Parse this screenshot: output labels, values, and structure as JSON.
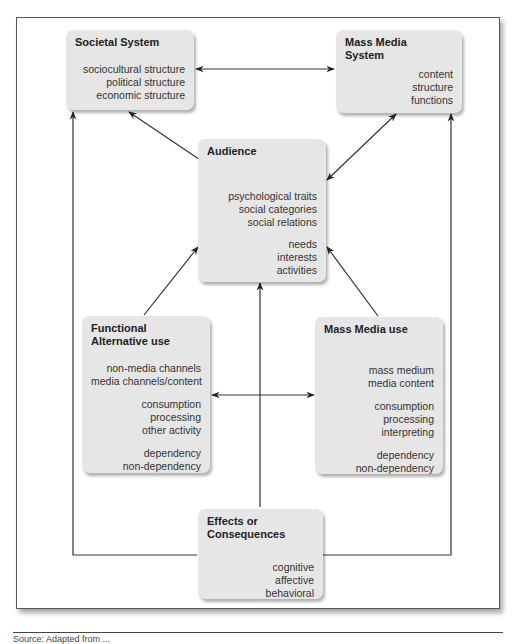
{
  "diagram": {
    "boxes": {
      "societal": {
        "title_lines": [
          "Societal System"
        ],
        "groups": [
          [
            "sociocultural structure",
            "political structure",
            "economic structure"
          ]
        ]
      },
      "mass_media_system": {
        "title_lines": [
          "Mass Media",
          "System"
        ],
        "groups": [
          [
            "content",
            "structure",
            "functions"
          ]
        ]
      },
      "audience": {
        "title_lines": [
          "Audience"
        ],
        "groups": [
          [
            "psychological traits",
            "social categories",
            "social relations"
          ],
          [
            "needs",
            "interests",
            "activities"
          ]
        ]
      },
      "functional_alternative": {
        "title_lines": [
          "Functional",
          "Alternative use"
        ],
        "groups": [
          [
            "non-media channels",
            "media channels/content"
          ],
          [
            "consumption",
            "processing",
            "other activity"
          ],
          [
            "dependency",
            "non-dependency"
          ]
        ]
      },
      "mass_media_use": {
        "title_lines": [
          "Mass Media use"
        ],
        "groups": [
          [
            "mass medium",
            "media content"
          ],
          [
            "consumption",
            "processing",
            "interpreting"
          ],
          [
            "dependency",
            "non-dependency"
          ]
        ]
      },
      "effects": {
        "title_lines": [
          "Effects or",
          "Consequences"
        ],
        "groups": [
          [
            "cognitive",
            "affective",
            "behavioral"
          ]
        ]
      }
    },
    "connections": [
      {
        "from": "Societal System",
        "to": "Mass Media System",
        "type": "bidirectional"
      },
      {
        "from": "Societal System",
        "to": "Audience",
        "type": "bidirectional"
      },
      {
        "from": "Mass Media System",
        "to": "Audience",
        "type": "bidirectional"
      },
      {
        "from": "Functional Alternative use",
        "to": "Audience",
        "type": "directed"
      },
      {
        "from": "Mass Media use",
        "to": "Audience",
        "type": "directed"
      },
      {
        "from": "Functional Alternative use",
        "to": "Mass Media use",
        "type": "bidirectional"
      },
      {
        "from": "Effects or Consequences",
        "to": "Audience",
        "type": "directed"
      },
      {
        "from": "Effects or Consequences",
        "to": "Societal System",
        "type": "directed"
      },
      {
        "from": "Effects or Consequences",
        "to": "Mass Media System",
        "type": "directed"
      }
    ],
    "caption": "Source: Adapted from ..."
  }
}
